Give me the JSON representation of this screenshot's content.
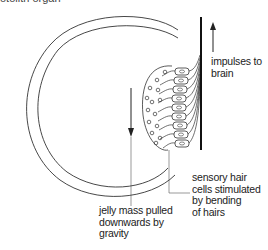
{
  "caption_cut": "otolith organ",
  "labels": {
    "impulses": [
      "impulses to",
      "brain"
    ],
    "hair_cells": [
      "sensory hair",
      "cells stimulated",
      "by bending",
      "of hairs"
    ],
    "jelly": [
      "jelly mass pulled",
      "downwards by",
      "gravity"
    ]
  },
  "colors": {
    "line": "#222222",
    "text": "#222222"
  }
}
